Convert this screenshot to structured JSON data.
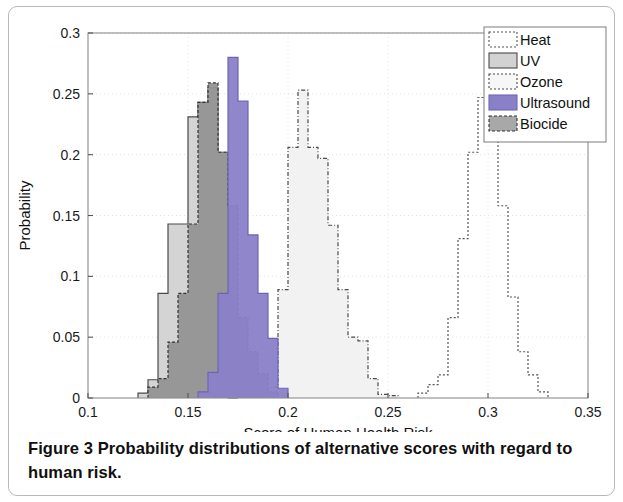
{
  "figure": {
    "caption_label": "Figure 3",
    "caption_text": " Probability distributions of alternative scores with regard to human risk."
  },
  "chart_data": {
    "type": "bar",
    "subtype": "overlaid-histograms",
    "title": "",
    "xlabel": "Score of Human Health Risk",
    "ylabel": "Probability",
    "xlim": [
      0.1,
      0.35
    ],
    "ylim": [
      0,
      0.3
    ],
    "xticks": [
      "0.1",
      "0.15",
      "0.2",
      "0.25",
      "0.3",
      "0.35"
    ],
    "xtick_values": [
      0.1,
      0.15,
      0.2,
      0.25,
      0.3,
      0.35
    ],
    "yticks": [
      "0",
      "0.05",
      "0.1",
      "0.15",
      "0.2",
      "0.25",
      "0.3"
    ],
    "ytick_values": [
      0,
      0.05,
      0.1,
      0.15,
      0.2,
      0.25,
      0.3
    ],
    "grid": true,
    "legend_position": "top-right",
    "bin_width": 0.005,
    "series": [
      {
        "name": "Heat",
        "color": "#ffffff",
        "edge": "#555555",
        "dash": "2,2",
        "bins": [
          0.265,
          0.27,
          0.275,
          0.28,
          0.285,
          0.29,
          0.295,
          0.3,
          0.305,
          0.31,
          0.315,
          0.32,
          0.325
        ],
        "values": [
          0.004,
          0.011,
          0.019,
          0.066,
          0.131,
          0.202,
          0.247,
          0.213,
          0.158,
          0.083,
          0.038,
          0.019,
          0.005
        ]
      },
      {
        "name": "UV",
        "color": "#d2d2d2",
        "edge": "#4a4a4a",
        "dash": "none",
        "bins": [
          0.125,
          0.13,
          0.135,
          0.14,
          0.145,
          0.15,
          0.155,
          0.16,
          0.165,
          0.17
        ],
        "values": [
          0.004,
          0.015,
          0.086,
          0.143,
          0.143,
          0.231,
          0.243,
          0.255,
          0.202,
          0.0
        ]
      },
      {
        "name": "Ozone",
        "color": "#f1f1f1",
        "edge": "#4a4a4a",
        "dash": "4,2,1,2",
        "bins": [
          0.185,
          0.19,
          0.195,
          0.2,
          0.205,
          0.21,
          0.215,
          0.22,
          0.225,
          0.23,
          0.235,
          0.24,
          0.245,
          0.25
        ],
        "values": [
          0.005,
          0.009,
          0.089,
          0.206,
          0.253,
          0.206,
          0.197,
          0.142,
          0.089,
          0.05,
          0.047,
          0.016,
          0.003,
          0.002
        ]
      },
      {
        "name": "Ultrasound",
        "color": "#8a80c8",
        "edge": "#6f64b4",
        "dash": "none",
        "bins": [
          0.155,
          0.16,
          0.165,
          0.17,
          0.175,
          0.18,
          0.185,
          0.19,
          0.195
        ],
        "values": [
          0.005,
          0.021,
          0.086,
          0.28,
          0.244,
          0.134,
          0.086,
          0.049,
          0.008
        ]
      },
      {
        "name": "Biocide",
        "color": "#949494",
        "edge": "#333333",
        "dash": "3,2",
        "bins": [
          0.13,
          0.135,
          0.14,
          0.145,
          0.15,
          0.155,
          0.16,
          0.165,
          0.17,
          0.175,
          0.18,
          0.185,
          0.19
        ],
        "values": [
          0.009,
          0.016,
          0.046,
          0.086,
          0.143,
          0.243,
          0.259,
          0.202,
          0.158,
          0.066,
          0.038,
          0.02,
          0.005
        ]
      }
    ],
    "legend": [
      {
        "label": "Heat",
        "color": "#ffffff",
        "edge": "#555555",
        "dash": "2,2"
      },
      {
        "label": "UV",
        "color": "#d2d2d2",
        "edge": "#4a4a4a",
        "dash": "none"
      },
      {
        "label": "Ozone",
        "color": "#f7f7f7",
        "edge": "#4a4a4a",
        "dash": "2,2"
      },
      {
        "label": "Ultrasound",
        "color": "#8a80c8",
        "edge": "#6f64b4",
        "dash": "none"
      },
      {
        "label": "Biocide",
        "color": "#a8a8a8",
        "edge": "#333333",
        "dash": "3,2"
      }
    ]
  }
}
